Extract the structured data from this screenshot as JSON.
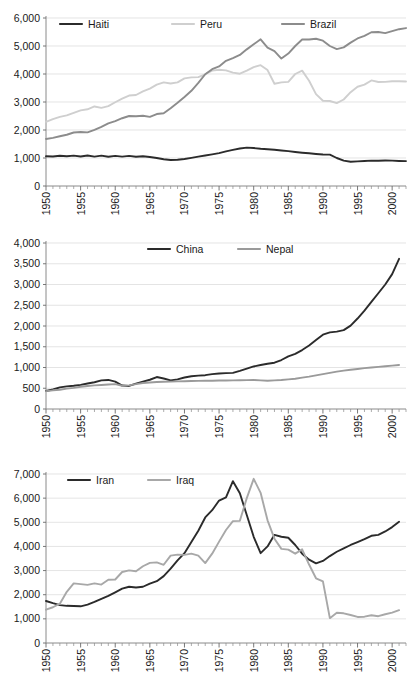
{
  "figure": {
    "panel_count": 3,
    "xlabel": "",
    "grid": true,
    "legend_position": "top-inside"
  },
  "chart_data": [
    {
      "id": "panel-1",
      "type": "line",
      "title": "",
      "xlabel": "",
      "ylabel": "",
      "xlim": [
        1950,
        2002
      ],
      "ylim": [
        0,
        6000
      ],
      "ytick_labels": [
        "0",
        "1,000",
        "2,000",
        "3,000",
        "4,000",
        "5,000",
        "6,000"
      ],
      "yticks": [
        0,
        1000,
        2000,
        3000,
        4000,
        5000,
        6000
      ],
      "xtick_labels": [
        "1950",
        "1955",
        "1960",
        "1965",
        "1970",
        "1975",
        "1980",
        "1985",
        "1990",
        "1995",
        "2000"
      ],
      "xticks": [
        1950,
        1955,
        1960,
        1965,
        1970,
        1975,
        1980,
        1985,
        1990,
        1995,
        2000
      ],
      "grid": true,
      "legend": [
        "Haiti",
        "Peru",
        "Brazil"
      ],
      "x": [
        1950,
        1951,
        1952,
        1953,
        1954,
        1955,
        1956,
        1957,
        1958,
        1959,
        1960,
        1961,
        1962,
        1963,
        1964,
        1965,
        1966,
        1967,
        1968,
        1969,
        1970,
        1971,
        1972,
        1973,
        1974,
        1975,
        1976,
        1977,
        1978,
        1979,
        1980,
        1981,
        1982,
        1983,
        1984,
        1985,
        1986,
        1987,
        1988,
        1989,
        1990,
        1991,
        1992,
        1993,
        1994,
        1995,
        1996,
        1997,
        1998,
        1999,
        2000,
        2001,
        2002
      ],
      "series": [
        {
          "name": "Haiti",
          "color": "#2b2b2b",
          "width": 1.9,
          "values": [
            1065,
            1055,
            1080,
            1060,
            1085,
            1055,
            1090,
            1050,
            1085,
            1045,
            1075,
            1050,
            1075,
            1045,
            1060,
            1035,
            1000,
            955,
            930,
            940,
            965,
            1005,
            1050,
            1090,
            1130,
            1175,
            1235,
            1290,
            1340,
            1370,
            1355,
            1330,
            1315,
            1295,
            1270,
            1245,
            1215,
            1190,
            1170,
            1145,
            1125,
            1120,
            1000,
            905,
            865,
            880,
            895,
            905,
            900,
            910,
            905,
            895,
            890
          ]
        },
        {
          "name": "Peru",
          "color": "#cfcfcf",
          "width": 1.9,
          "values": [
            2290,
            2390,
            2470,
            2520,
            2610,
            2700,
            2740,
            2840,
            2790,
            2850,
            2990,
            3120,
            3230,
            3250,
            3380,
            3480,
            3620,
            3700,
            3660,
            3700,
            3845,
            3880,
            3890,
            3990,
            4120,
            4150,
            4130,
            4050,
            4010,
            4120,
            4245,
            4315,
            4140,
            3650,
            3700,
            3720,
            4000,
            4120,
            3760,
            3280,
            3045,
            3035,
            2960,
            3090,
            3350,
            3545,
            3620,
            3770,
            3715,
            3720,
            3740,
            3740,
            3730
          ]
        },
        {
          "name": "Brazil",
          "color": "#8c8c8c",
          "width": 1.9,
          "values": [
            1680,
            1720,
            1775,
            1830,
            1910,
            1930,
            1915,
            2005,
            2115,
            2235,
            2320,
            2420,
            2500,
            2490,
            2510,
            2470,
            2570,
            2600,
            2780,
            2975,
            3180,
            3400,
            3680,
            3990,
            4170,
            4270,
            4470,
            4570,
            4680,
            4880,
            5060,
            5240,
            4940,
            4820,
            4550,
            4730,
            5000,
            5230,
            5230,
            5260,
            5190,
            5000,
            4890,
            4950,
            5120,
            5270,
            5360,
            5490,
            5500,
            5460,
            5530,
            5600,
            5640
          ]
        }
      ]
    },
    {
      "id": "panel-2",
      "type": "line",
      "title": "",
      "xlabel": "",
      "ylabel": "",
      "xlim": [
        1950,
        2002
      ],
      "ylim": [
        0,
        4000
      ],
      "ytick_labels": [
        "0",
        "500",
        "1,000",
        "1,500",
        "2,000",
        "2,500",
        "3,000",
        "3,500",
        "4,000"
      ],
      "yticks": [
        0,
        500,
        1000,
        1500,
        2000,
        2500,
        3000,
        3500,
        4000
      ],
      "xtick_labels": [
        "1950",
        "1955",
        "1960",
        "1965",
        "1970",
        "1975",
        "1980",
        "1985",
        "1990",
        "1995",
        "2000"
      ],
      "xticks": [
        1950,
        1955,
        1960,
        1965,
        1970,
        1975,
        1980,
        1985,
        1990,
        1995,
        2000
      ],
      "grid": true,
      "legend": [
        "China",
        "Nepal"
      ],
      "x": [
        1950,
        1951,
        1952,
        1953,
        1954,
        1955,
        1956,
        1957,
        1958,
        1959,
        1960,
        1961,
        1962,
        1963,
        1964,
        1965,
        1966,
        1967,
        1968,
        1969,
        1970,
        1971,
        1972,
        1973,
        1974,
        1975,
        1976,
        1977,
        1978,
        1979,
        1980,
        1981,
        1982,
        1983,
        1984,
        1985,
        1986,
        1987,
        1988,
        1989,
        1990,
        1991,
        1992,
        1993,
        1994,
        1995,
        1996,
        1997,
        1998,
        1999,
        2000,
        2001
      ],
      "series": [
        {
          "name": "China",
          "color": "#2b2b2b",
          "width": 1.9,
          "values": [
            435,
            470,
            520,
            545,
            560,
            580,
            615,
            645,
            690,
            700,
            660,
            565,
            555,
            610,
            660,
            705,
            770,
            735,
            690,
            715,
            760,
            790,
            805,
            815,
            840,
            855,
            865,
            870,
            920,
            975,
            1025,
            1060,
            1090,
            1115,
            1180,
            1270,
            1330,
            1420,
            1530,
            1660,
            1790,
            1845,
            1865,
            1900,
            2010,
            2180,
            2370,
            2580,
            2790,
            3000,
            3250,
            3620
          ]
        },
        {
          "name": "Nepal",
          "color": "#9a9a9a",
          "width": 1.9,
          "values": [
            430,
            450,
            465,
            490,
            510,
            535,
            555,
            570,
            580,
            590,
            600,
            560,
            570,
            600,
            625,
            640,
            650,
            655,
            660,
            665,
            670,
            675,
            678,
            680,
            682,
            685,
            688,
            690,
            692,
            695,
            700,
            690,
            680,
            690,
            700,
            715,
            730,
            755,
            780,
            810,
            840,
            870,
            900,
            925,
            945,
            965,
            985,
            1000,
            1015,
            1030,
            1045,
            1060
          ]
        }
      ]
    },
    {
      "id": "panel-3",
      "type": "line",
      "title": "",
      "xlabel": "",
      "ylabel": "",
      "xlim": [
        1950,
        2002
      ],
      "ylim": [
        0,
        7000
      ],
      "ytick_labels": [
        "0",
        "1,000",
        "2,000",
        "3,000",
        "4,000",
        "5,000",
        "6,000",
        "7,000"
      ],
      "yticks": [
        0,
        1000,
        2000,
        3000,
        4000,
        5000,
        6000,
        7000
      ],
      "xtick_labels": [
        "1950",
        "1955",
        "1960",
        "1965",
        "1970",
        "1975",
        "1980",
        "1985",
        "1990",
        "1995",
        "2000"
      ],
      "xticks": [
        1950,
        1955,
        1960,
        1965,
        1970,
        1975,
        1980,
        1985,
        1990,
        1995,
        2000
      ],
      "grid": true,
      "legend": [
        "Iran",
        "Iraq"
      ],
      "x": [
        1950,
        1951,
        1952,
        1953,
        1954,
        1955,
        1956,
        1957,
        1958,
        1959,
        1960,
        1961,
        1962,
        1963,
        1964,
        1965,
        1966,
        1967,
        1968,
        1969,
        1970,
        1971,
        1972,
        1973,
        1974,
        1975,
        1976,
        1977,
        1978,
        1979,
        1980,
        1981,
        1982,
        1983,
        1984,
        1985,
        1986,
        1987,
        1988,
        1989,
        1990,
        1991,
        1992,
        1993,
        1994,
        1995,
        1996,
        1997,
        1998,
        1999,
        2000,
        2001
      ],
      "series": [
        {
          "name": "Iran",
          "color": "#2b2b2b",
          "width": 1.9,
          "values": [
            1740,
            1650,
            1570,
            1540,
            1530,
            1520,
            1590,
            1700,
            1830,
            1950,
            2100,
            2250,
            2330,
            2300,
            2330,
            2460,
            2560,
            2770,
            3080,
            3420,
            3720,
            4180,
            4650,
            5200,
            5500,
            5900,
            6030,
            6700,
            6200,
            5300,
            4400,
            3720,
            4000,
            4480,
            4400,
            4360,
            4060,
            3700,
            3450,
            3300,
            3400,
            3600,
            3780,
            3920,
            4060,
            4180,
            4300,
            4440,
            4480,
            4620,
            4800,
            5020
          ]
        },
        {
          "name": "Iraq",
          "color": "#a8a8a8",
          "width": 1.9,
          "values": [
            1380,
            1480,
            1630,
            2120,
            2470,
            2440,
            2410,
            2470,
            2420,
            2620,
            2630,
            2940,
            3010,
            2970,
            3180,
            3320,
            3340,
            3240,
            3620,
            3660,
            3650,
            3700,
            3620,
            3310,
            3700,
            4200,
            4680,
            5050,
            5060,
            6000,
            6800,
            6220,
            5080,
            4320,
            3900,
            3870,
            3700,
            3880,
            3250,
            2680,
            2550,
            1030,
            1250,
            1230,
            1160,
            1080,
            1090,
            1150,
            1110,
            1190,
            1260,
            1360
          ]
        }
      ]
    }
  ]
}
